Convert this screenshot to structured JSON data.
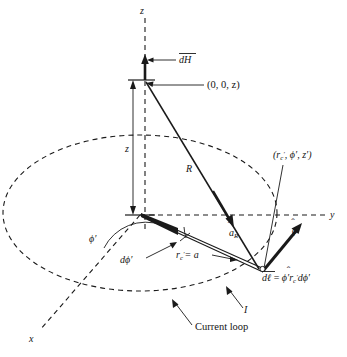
{
  "figure": {
    "background_color": "#ffffff",
    "line_color": "#1a1a1a"
  },
  "axes": {
    "z_label": "z",
    "y_label": "y",
    "x_label": "x"
  },
  "labels": {
    "dH": "dH",
    "field_point": "(0, 0, z)",
    "z_distance": "z",
    "R": "R",
    "source_point": "(r",
    "source_point_sub_c": "c",
    "source_point_rest": ", ϕ′, z′)",
    "a_R": "a",
    "a_R_sub": "R",
    "phi_prime_angle": "ϕ′",
    "d_phi_prime": "dϕ′",
    "radius_eq": "= a",
    "radius_r": "r",
    "radius_sub": "c",
    "phi_hat_prime": "ϕ′",
    "dl_equation_lhs": "dℓ",
    "dl_equation_rhs_phi": "ϕ′",
    "dl_equation_rhs_r": "r",
    "dl_equation_rhs_sub": "c",
    "dl_equation_rhs_tail": "dϕ′",
    "current": "I",
    "current_loop": "Current loop"
  },
  "geometry": {
    "origin": {
      "x": 140,
      "y": 215
    },
    "ellipse": {
      "cx": 140,
      "cy": 213,
      "rx": 137,
      "ry": 78
    },
    "field_point": {
      "x": 145,
      "y": 80
    },
    "source_point": {
      "x": 262,
      "y": 272
    },
    "z_axis_top": {
      "x": 145,
      "y": 18
    },
    "y_axis_right": {
      "x": 328,
      "y": 215
    },
    "x_axis_end": {
      "x": 40,
      "y": 330
    }
  }
}
